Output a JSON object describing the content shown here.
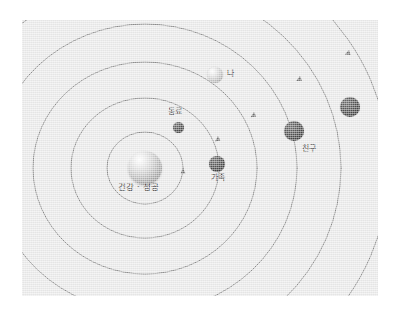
{
  "diagram": {
    "background_color": "#ffffff",
    "panel_color": "#e9e9e9",
    "orbit_stroke_color": "#8a8a8a",
    "label_color": "#1d1d1d",
    "center": {
      "label": "건강 · 성공",
      "cx": 145,
      "cy": 168,
      "radius": 17
    },
    "orbits": [
      {
        "name": "orbit-1",
        "rx": 38,
        "ry": 36
      },
      {
        "name": "orbit-2",
        "rx": 74,
        "ry": 70
      },
      {
        "name": "orbit-3",
        "rx": 112,
        "ry": 106
      },
      {
        "name": "orbit-4",
        "rx": 152,
        "ry": 144
      },
      {
        "name": "orbit-5",
        "rx": 196,
        "ry": 186
      }
    ],
    "bodies": [
      {
        "id": "dongryo",
        "label": "동료",
        "tone": "dark",
        "cx": 178,
        "cy": 127,
        "radius": 5.5,
        "orbit": "orbit-2",
        "label_x": 168,
        "label_y": 112
      },
      {
        "id": "gajok",
        "label": "가족",
        "tone": "dark",
        "cx": 217,
        "cy": 164,
        "radius": 8,
        "orbit": "orbit-3",
        "label_x": 211,
        "label_y": 177
      },
      {
        "id": "na",
        "label": "나",
        "tone": "light",
        "cx": 215,
        "cy": 75,
        "radius": 8,
        "orbit": "orbit-4",
        "label_x": 227,
        "label_y": 69
      },
      {
        "id": "chingu",
        "label": "친구",
        "tone": "dark",
        "cx": 294,
        "cy": 131,
        "radius": 10,
        "orbit": "orbit-5",
        "label_x": 302,
        "label_y": 146
      },
      {
        "id": "outer-body",
        "label": "",
        "tone": "dark",
        "cx": 350,
        "cy": 107,
        "radius": 10,
        "orbit": "orbit-6",
        "label_x": 0,
        "label_y": 0
      }
    ],
    "direction_arrows": {
      "description": "궤도 진행 방향 화살표 (반시계 방향)",
      "count": 5
    }
  }
}
